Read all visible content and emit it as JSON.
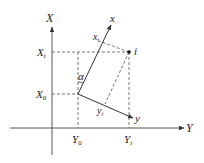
{
  "diagram": {
    "type": "coordinate-rotation",
    "global_axes": {
      "vertical_label": "X",
      "horizontal_label": "Y"
    },
    "local_axes": {
      "x_label": "x",
      "y_label": "y"
    },
    "tick_labels": {
      "X_i": "X",
      "X_i_sub": "i",
      "X_0": "X",
      "X_0_sub": "0",
      "Y_0": "Y",
      "Y_0_sub": "0",
      "Y_i": "Y",
      "Y_i_sub": "i"
    },
    "point_label": "i",
    "angle_label": "α",
    "local_coord_labels": {
      "x_i": "x",
      "x_i_sub": "i",
      "y_i": "y",
      "y_i_sub": "i"
    },
    "colors": {
      "line": "#333333",
      "dash": "#555555",
      "background": "#ffffff"
    }
  }
}
